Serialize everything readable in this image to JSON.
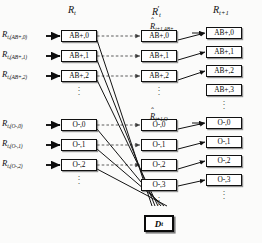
{
  "figure": {
    "type": "state-transition-diagram",
    "columns": [
      {
        "id": "col1",
        "header": "R",
        "header_sub": "t",
        "header_prime": false
      },
      {
        "id": "col2",
        "header": "R",
        "header_sub": "t",
        "header_prime": true
      },
      {
        "id": "col3",
        "header": "R",
        "header_sub": "t+1",
        "header_prime": false
      }
    ],
    "column_headers_rendered": [
      "R t",
      "R' t",
      "R t+1"
    ],
    "input_labels_ab": [
      {
        "base": "R",
        "sub": "t,(AB+,0)"
      },
      {
        "base": "R",
        "sub": "t,(AB+,1)"
      },
      {
        "base": "R",
        "sub": "t,(AB+,2)"
      }
    ],
    "input_labels_o": [
      {
        "base": "R",
        "sub": "t,(O-,0)"
      },
      {
        "base": "R",
        "sub": "t,(O-,1)"
      },
      {
        "base": "R",
        "sub": "t,(O-,2)"
      }
    ],
    "col1_boxes_ab": [
      "AB+,0",
      "AB+,1",
      "AB+,2"
    ],
    "col1_boxes_o": [
      "O-,0",
      "O-,1",
      "O-,2"
    ],
    "col2_boxes_ab": [
      "AB+,0",
      "AB+,1",
      "AB+,2"
    ],
    "col2_boxes_o": [
      "O-,0",
      "O-,1",
      "O-,2",
      "O-,3"
    ],
    "col3_boxes_ab": [
      "AB+,0",
      "AB+,1",
      "AB+,2",
      "AB+,3"
    ],
    "col3_boxes_o": [
      "O-,0",
      "O-,1",
      "O-,2",
      "O-,3"
    ],
    "hat_label_ab": {
      "base": "R",
      "sub": "t+1,AB+"
    },
    "hat_label_o": {
      "base": "R",
      "sub": "t+1,O-"
    },
    "demand_box": {
      "base": "D",
      "sub": "t"
    },
    "ellipsis_glyph": "·",
    "colors": {
      "line": "#111111",
      "dashed_line": "#555555",
      "box_border": "#111111",
      "box_fill": "#ffffff",
      "background": "#fbfbfa"
    }
  }
}
